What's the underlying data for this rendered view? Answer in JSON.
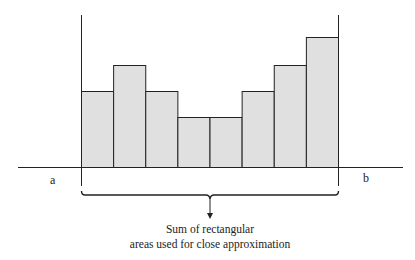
{
  "diagram": {
    "type": "riemann-sum-illustration",
    "label_a": "a",
    "label_b": "b",
    "caption_line1": "Sum of rectangular",
    "caption_line2": "areas used for close approximation",
    "bar_fill": "#e0e0e0",
    "stroke": "#222222"
  },
  "chart_data": {
    "type": "bar",
    "title": "",
    "xlabel": "",
    "ylabel": "",
    "x_bounds": [
      "a",
      "b"
    ],
    "categories": [
      "1",
      "2",
      "3",
      "4",
      "5",
      "6",
      "7",
      "8"
    ],
    "values": [
      76,
      102,
      76,
      50,
      50,
      76,
      102,
      130
    ],
    "annotation": "Sum of rectangular areas used for close approximation",
    "grid": false
  }
}
